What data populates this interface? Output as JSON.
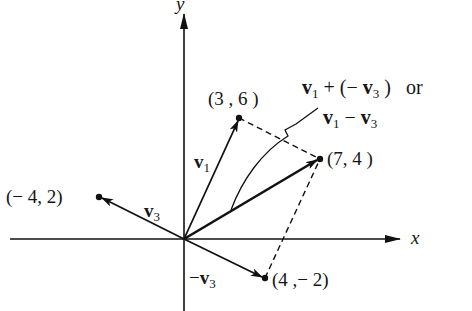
{
  "diagram": {
    "type": "vector-addition",
    "axes": {
      "x_label": "x",
      "y_label": "y"
    },
    "origin": [
      0,
      0
    ],
    "points": [
      {
        "id": "p_v1",
        "label": "(3 , 6 )",
        "coords": [
          3,
          6
        ]
      },
      {
        "id": "p_sum",
        "label": "(7, 4 )",
        "coords": [
          7,
          4
        ]
      },
      {
        "id": "p_v3",
        "label": "(− 4,  2)",
        "coords": [
          -4,
          2
        ]
      },
      {
        "id": "p_negv3",
        "label": "(4 ,− 2)",
        "coords": [
          4,
          -2
        ]
      }
    ],
    "vectors": [
      {
        "name": "v1",
        "label_main": "v",
        "label_sub": "1",
        "from": [
          0,
          0
        ],
        "to": [
          3,
          6
        ]
      },
      {
        "name": "v3",
        "label_main": "v",
        "label_sub": "3",
        "from": [
          0,
          0
        ],
        "to": [
          -4,
          2
        ]
      },
      {
        "name": "neg_v3",
        "label_prefix": "−",
        "label_main": "v",
        "label_sub": "3",
        "from": [
          0,
          0
        ],
        "to": [
          4,
          -2
        ]
      },
      {
        "name": "sum",
        "from": [
          0,
          0
        ],
        "to": [
          7,
          4
        ]
      }
    ],
    "annotation": {
      "line1_a": "v",
      "line1_a_sub": "1",
      "line1_op": " + (− ",
      "line1_b": "v",
      "line1_b_sub": "3",
      "line1_end": " )   or",
      "line2_a": "v",
      "line2_a_sub": "1",
      "line2_op": " − ",
      "line2_b": "v",
      "line2_b_sub": "3"
    },
    "dashed_edges": [
      [
        [
          3,
          6
        ],
        [
          7,
          4
        ]
      ],
      [
        [
          4,
          -2
        ],
        [
          7,
          4
        ]
      ]
    ]
  }
}
